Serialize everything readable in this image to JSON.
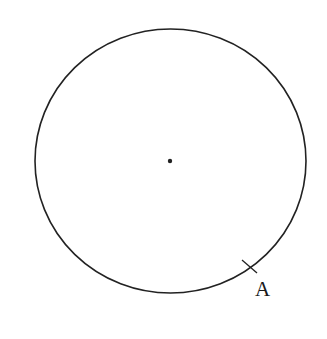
{
  "diagram": {
    "type": "geometry",
    "stroke_color": "#222222",
    "background_color": "#ffffff",
    "circle": {
      "cx": 170.5,
      "cy": 161,
      "rx": 135.5,
      "ry": 132,
      "stroke_width": 1.6
    },
    "center_point": {
      "cx": 170,
      "cy": 161,
      "r": 2.2
    },
    "tick_mark": {
      "x1": 242,
      "y1": 260,
      "x2": 257,
      "y2": 273,
      "stroke_width": 1.3
    },
    "labels": [
      {
        "id": "A",
        "text": "A",
        "x": 255,
        "y": 279
      }
    ]
  }
}
